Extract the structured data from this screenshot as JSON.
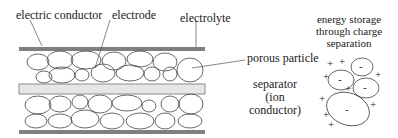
{
  "labels": {
    "electric_conductor": "electric conductor",
    "electrode": "electrode",
    "electrolyte": "electrolyte",
    "porous_particle": "porous particle",
    "separator_line1": "separator",
    "separator_line2": "(ion",
    "separator_line3": "conductor)",
    "energy_line1": "energy storage",
    "energy_line2": "through charge",
    "energy_line3": "separation"
  },
  "symbols": {
    "plus": "+",
    "minus": "-"
  },
  "colors": {
    "conductor_bar": "#7f7f7f",
    "separator_bar": "#e6e6e6",
    "separator_edge": "#8c8c8c",
    "outline": "#444444"
  }
}
